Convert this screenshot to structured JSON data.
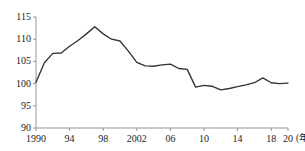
{
  "chart_data": {
    "type": "line",
    "title": "",
    "subtitle": "",
    "xlabel": "(年)",
    "ylabel": "",
    "xlim": [
      1990,
      2020
    ],
    "ylim": [
      90,
      115
    ],
    "grid": false,
    "legend": null,
    "x_tick_labels": [
      "1990",
      "94",
      "98",
      "2002",
      "06",
      "10",
      "14",
      "18",
      "20"
    ],
    "x_tick_values": [
      1990,
      1994,
      1998,
      2002,
      2006,
      2010,
      2014,
      2018,
      2020
    ],
    "y_tick_labels": [
      "90",
      "95",
      "100",
      "105",
      "110",
      "115"
    ],
    "y_tick_values": [
      90,
      95,
      100,
      105,
      110,
      115
    ],
    "x": [
      1990,
      1991,
      1992,
      1993,
      1994,
      1995,
      1996,
      1997,
      1998,
      1999,
      2000,
      2001,
      2002,
      2003,
      2004,
      2005,
      2006,
      2007,
      2008,
      2009,
      2010,
      2011,
      2012,
      2013,
      2014,
      2015,
      2016,
      2017,
      2018,
      2019,
      2020
    ],
    "values": [
      100.3,
      104.7,
      106.8,
      106.9,
      108.4,
      109.7,
      111.2,
      112.8,
      111.2,
      110.0,
      109.6,
      107.3,
      104.8,
      104.0,
      103.9,
      104.2,
      104.4,
      103.4,
      103.2,
      99.2,
      99.6,
      99.4,
      98.6,
      98.9,
      99.3,
      99.7,
      100.2,
      101.3,
      100.2,
      100.0,
      100.1
    ],
    "series_name": "index",
    "line_color": "#333333",
    "axis_color": "#808080"
  },
  "axis": {
    "unit_label": "(年)"
  }
}
